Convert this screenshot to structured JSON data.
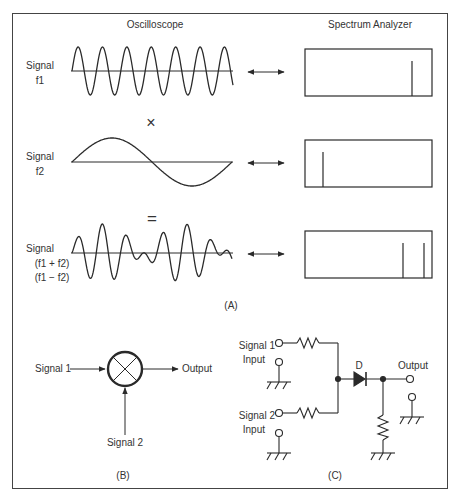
{
  "figure": {
    "panel_a": {
      "caption": "(A)",
      "headers": {
        "oscilloscope": "Oscilloscope",
        "spectrum": "Spectrum Analyzer"
      },
      "rows": [
        {
          "label_line1": "Signal",
          "label_line2": "f1",
          "label_line3": "",
          "operator": "",
          "waveform": "sine-high-frequency",
          "spectrum_lines_x": [
            412
          ]
        },
        {
          "label_line1": "Signal",
          "label_line2": "f2",
          "label_line3": "",
          "operator": "×",
          "waveform": "sine-low-frequency",
          "spectrum_lines_x": [
            323
          ]
        },
        {
          "label_line1": "Signal",
          "label_line2": "(f1 + f2)",
          "label_line3": "(f1 − f2)",
          "operator": "=",
          "waveform": "product-beat",
          "spectrum_lines_x": [
            403,
            424
          ]
        }
      ],
      "arrow": "double-arrow"
    },
    "panel_b": {
      "caption": "(B)",
      "input1": "Signal 1",
      "input2": "Signal 2",
      "output": "Output",
      "symbol": "mixer-circle-x"
    },
    "panel_c": {
      "caption": "(C)",
      "input1_line1": "Signal 1",
      "input1_line2": "Input",
      "input2_line1": "Signal 2",
      "input2_line2": "Input",
      "diode_label": "D",
      "output": "Output"
    },
    "colors": {
      "line": "#2a2a2a",
      "frame": "#444444",
      "text": "#333333",
      "background": "#ffffff"
    }
  }
}
